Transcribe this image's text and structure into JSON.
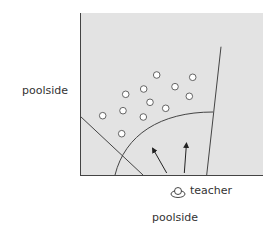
{
  "diagram": {
    "type": "pool layout / teacher positioning (top view)",
    "colors": {
      "pool_fill": "#e3e3e3",
      "line": "#444444",
      "dot_fill": "#ffffff",
      "dot_stroke": "#555555",
      "text": "#333333"
    },
    "labels": {
      "left_side": "poolside",
      "bottom_side": "poolside",
      "teacher": "teacher"
    },
    "pool_box": {
      "x": 80,
      "y": 13,
      "width": 183,
      "height": 162
    },
    "swimmers": [
      {
        "x": 156.7,
        "y": 75
      },
      {
        "x": 192.7,
        "y": 77.3
      },
      {
        "x": 175,
        "y": 86.7
      },
      {
        "x": 143.7,
        "y": 89
      },
      {
        "x": 125.7,
        "y": 94.3
      },
      {
        "x": 189.3,
        "y": 96.3
      },
      {
        "x": 150,
        "y": 102.3
      },
      {
        "x": 165.7,
        "y": 108.3
      },
      {
        "x": 123,
        "y": 110.7
      },
      {
        "x": 143.3,
        "y": 117
      },
      {
        "x": 102.7,
        "y": 115.7
      },
      {
        "x": 121.7,
        "y": 133.7
      }
    ],
    "lines": {
      "left_diagonal": {
        "x1": 80,
        "y1": 116,
        "x2": 143,
        "y2": 175
      },
      "right_boundary": {
        "x1": 206.7,
        "y1": 175,
        "x2": 221,
        "y2": 46.7
      },
      "arc": {
        "start_x": 115,
        "start_y": 175,
        "end_x": 213,
        "end_y": 112
      }
    },
    "arrows": [
      {
        "x1": 166.7,
        "y1": 173,
        "x2": 151.7,
        "y2": 146.7
      },
      {
        "x1": 184.3,
        "y1": 173,
        "x2": 186.7,
        "y2": 141.7
      }
    ],
    "teacher_icon": {
      "name": "teacher-top-view-icon",
      "x": 178,
      "y": 190
    }
  }
}
